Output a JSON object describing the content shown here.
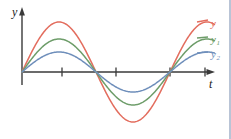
{
  "figure": {
    "background_color": "#ffffff",
    "border_color": "#b9c4d6",
    "axis_color": "#3a3a3a"
  },
  "axes": {
    "y_axis_label": "y",
    "t_axis_label": "t",
    "origin_px": [
      22,
      72
    ],
    "y_axis_top_px": 10,
    "y_axis_bottom_px": 85,
    "t_axis_right_px": 214,
    "tick_positions_px": [
      62,
      116,
      170,
      205
    ],
    "tick_labels": [
      "",
      "",
      "",
      ""
    ],
    "grid": false
  },
  "legend": {
    "position": "right",
    "entries": [
      {
        "label": "y",
        "subscript": "",
        "color": "#e36d5e"
      },
      {
        "label": "y",
        "subscript": "1",
        "color": "#6e9d6a"
      },
      {
        "label": "y",
        "subscript": "2",
        "color": "#6f8fbb"
      }
    ]
  },
  "chart_data": {
    "type": "line",
    "title": "",
    "subtitle": "",
    "xlabel": "t",
    "ylabel": "y",
    "xlim": [
      0,
      1.3
    ],
    "ylim": [
      -1.05,
      1.05
    ],
    "grid": false,
    "legend_position": "right",
    "annotations": [],
    "x_tick_labels": [],
    "y_tick_labels": [],
    "period_in_x_units": 1.0,
    "phase": 0,
    "x": [
      0,
      0.05,
      0.1,
      0.15,
      0.2,
      0.25,
      0.3,
      0.35,
      0.4,
      0.45,
      0.5,
      0.55,
      0.6,
      0.65,
      0.7,
      0.75,
      0.8,
      0.85,
      0.9,
      0.95,
      1.0,
      1.05,
      1.1,
      1.15,
      1.2
    ],
    "series": [
      {
        "name": "y",
        "color": "#e36d5e",
        "amplitude": 1.0,
        "values": [
          0,
          0.309,
          0.588,
          0.809,
          0.951,
          1.0,
          0.951,
          0.809,
          0.588,
          0.309,
          0,
          -0.309,
          -0.588,
          -0.809,
          -0.951,
          -1.0,
          -0.951,
          -0.809,
          -0.588,
          -0.309,
          0,
          0.309,
          0.588,
          0.809,
          0.951
        ]
      },
      {
        "name": "y1",
        "color": "#6e9d6a",
        "amplitude": 0.66,
        "values": [
          0,
          0.204,
          0.388,
          0.534,
          0.628,
          0.66,
          0.628,
          0.534,
          0.388,
          0.204,
          0,
          -0.204,
          -0.388,
          -0.534,
          -0.628,
          -0.66,
          -0.628,
          -0.534,
          -0.388,
          -0.204,
          0,
          0.204,
          0.388,
          0.534,
          0.628
        ]
      },
      {
        "name": "y2",
        "color": "#6f8fbb",
        "amplitude": 0.4,
        "values": [
          0,
          0.124,
          0.235,
          0.324,
          0.38,
          0.4,
          0.38,
          0.324,
          0.235,
          0.124,
          0,
          -0.124,
          -0.235,
          -0.324,
          -0.38,
          -0.4,
          -0.38,
          -0.324,
          -0.235,
          -0.124,
          0,
          0.124,
          0.235,
          0.324,
          0.38
        ]
      }
    ]
  }
}
